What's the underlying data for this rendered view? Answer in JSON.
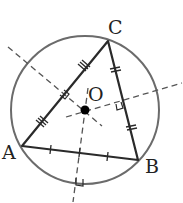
{
  "diagram": {
    "colors": {
      "circle": "#6b6b6b",
      "triangle": "#2a2a2a",
      "bisector": "#555555",
      "center_point": "#000000",
      "label": "#222222"
    },
    "points": {
      "A": {
        "label": "A",
        "x": 22,
        "y": 146
      },
      "B": {
        "label": "B",
        "x": 138,
        "y": 160
      },
      "C": {
        "label": "C",
        "x": 108,
        "y": 41
      },
      "O": {
        "label": "O",
        "x": 85,
        "y": 110
      }
    },
    "circle": {
      "cx": 85,
      "cy": 110,
      "r": 74
    },
    "segments": [
      {
        "from": "A",
        "to": "B",
        "tick_marks": 1
      },
      {
        "from": "B",
        "to": "C",
        "tick_marks": 2
      },
      {
        "from": "C",
        "to": "A",
        "tick_marks": 3
      }
    ],
    "perpendicular_bisectors": [
      {
        "of": "AC",
        "style": "dashed",
        "right_angle_mark": true
      },
      {
        "of": "BC",
        "style": "dashed",
        "right_angle_mark": true
      },
      {
        "of": "AB",
        "style": "dashed",
        "right_angle_mark": true
      }
    ]
  }
}
